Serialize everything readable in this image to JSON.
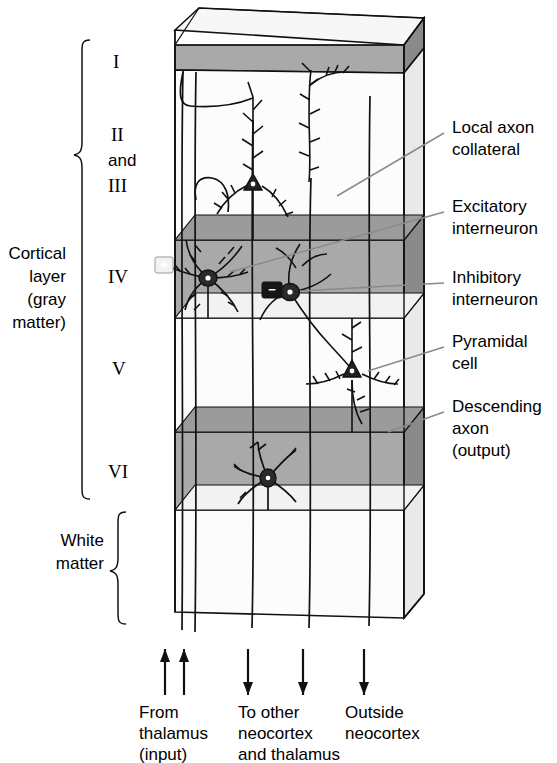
{
  "figure": {
    "type": "neuroanatomy-schematic"
  },
  "colors": {
    "band_front": "#a9a9a9",
    "band_side": "#878787",
    "band_top": "#9a9a9a",
    "block_front": "#fbfbfb",
    "block_side": "#e8e8e8",
    "block_top": "#f4f4f4",
    "stroke": "#111111",
    "leader": "#7a7a7a",
    "background": "#ffffff"
  },
  "left_brackets": [
    {
      "name": "cortical-layer",
      "label_lines": [
        "Cortical",
        "layer",
        "(gray",
        "matter)"
      ]
    },
    {
      "name": "white-matter",
      "label_lines": [
        "White",
        "matter"
      ]
    }
  ],
  "layers": [
    {
      "id": "I",
      "label": "I",
      "shaded": true
    },
    {
      "id": "II-III",
      "label_lines": [
        "II",
        "and",
        "III"
      ],
      "shaded": false
    },
    {
      "id": "IV",
      "label": "IV",
      "shaded": true
    },
    {
      "id": "V",
      "label": "V",
      "shaded": false
    },
    {
      "id": "VI",
      "label": "VI",
      "shaded": true
    },
    {
      "id": "WM",
      "label": "",
      "shaded": false
    }
  ],
  "right_labels": [
    {
      "name": "local-axon-collateral",
      "lines": [
        "Local axon",
        "collateral"
      ]
    },
    {
      "name": "excitatory-interneuron",
      "lines": [
        "Excitatory",
        "interneuron"
      ]
    },
    {
      "name": "inhibitory-interneuron",
      "lines": [
        "Inhibitory",
        "interneuron"
      ]
    },
    {
      "name": "pyramidal-cell",
      "lines": [
        "Pyramidal",
        "cell"
      ]
    },
    {
      "name": "descending-axon",
      "lines": [
        "Descending",
        "axon",
        "(output)"
      ]
    }
  ],
  "bottom_labels": [
    {
      "name": "from-thalamus",
      "lines": [
        "From",
        "thalamus",
        "(input)"
      ],
      "direction": "up",
      "arrows": 2
    },
    {
      "name": "to-other-neocortex",
      "lines": [
        "To other",
        "neocortex",
        "and thalamus"
      ],
      "direction": "down",
      "arrows": 2
    },
    {
      "name": "outside-neocortex",
      "lines": [
        "Outside",
        "neocortex"
      ],
      "direction": "down",
      "arrows": 1
    }
  ],
  "neuron_symbols": {
    "excitatory": "+",
    "inhibitory": "−"
  },
  "cells": [
    {
      "name": "pyramidal-cell-superficial",
      "layer": "II-III"
    },
    {
      "name": "excitatory-interneuron-cell",
      "layer": "IV",
      "symbol": "+"
    },
    {
      "name": "inhibitory-interneuron-cell",
      "layer": "IV",
      "symbol": "−"
    },
    {
      "name": "pyramidal-cell-deep",
      "layer": "V"
    },
    {
      "name": "pyramidal-cell-layer6",
      "layer": "VI"
    }
  ]
}
